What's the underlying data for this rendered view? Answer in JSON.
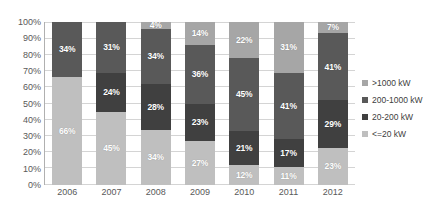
{
  "chart_data": {
    "type": "bar",
    "subtype": "100% stacked column",
    "title": "",
    "subtitle": "",
    "xlabel": "",
    "ylabel": "",
    "ylim": [
      0,
      100
    ],
    "yticks": [
      "0%",
      "10%",
      "20%",
      "30%",
      "40%",
      "50%",
      "60%",
      "70%",
      "80%",
      "90%",
      "100%"
    ],
    "grid": true,
    "legend_position": "right",
    "categories": [
      "2006",
      "2007",
      "2008",
      "2009",
      "2010",
      "2011",
      "2012"
    ],
    "series": [
      {
        "name": ">1000 kW",
        "color": "#a6a6a6",
        "values": [
          0,
          0,
          4,
          14,
          22,
          31,
          7
        ],
        "labels": [
          "",
          "",
          "4%",
          "14%",
          "22%",
          "31%",
          "7%"
        ]
      },
      {
        "name": "200-1000 kW",
        "color": "#595959",
        "values": [
          34,
          31,
          34,
          36,
          45,
          41,
          41
        ],
        "labels": [
          "34%",
          "31%",
          "34%",
          "36%",
          "45%",
          "41%",
          "41%"
        ]
      },
      {
        "name": "20-200 kW",
        "color": "#404040",
        "values": [
          0,
          24,
          28,
          23,
          21,
          17,
          29
        ],
        "labels": [
          "",
          "24%",
          "28%",
          "23%",
          "21%",
          "17%",
          "29%"
        ]
      },
      {
        "name": "<=20 kW",
        "color": "#bfbfbf",
        "values": [
          66,
          45,
          34,
          27,
          12,
          11,
          23
        ],
        "labels": [
          "66%",
          "45%",
          "34%",
          "27%",
          "12%",
          "11%",
          "23%"
        ]
      }
    ]
  }
}
